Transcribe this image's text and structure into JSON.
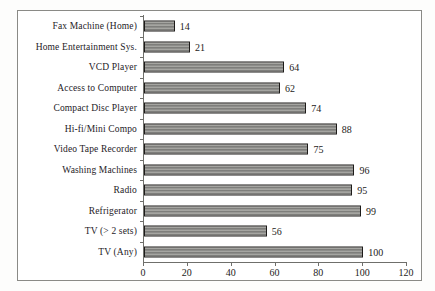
{
  "figure": {
    "background_color": "#ffffff",
    "frame_color": "#8a8a86",
    "bar_fill_color": "#999996",
    "bar_border_color": "#1d1b19",
    "text_color": "#1d1b19"
  },
  "chart_data": {
    "type": "bar",
    "orientation": "horizontal",
    "title": "",
    "subtitle": "",
    "xlabel": "",
    "ylabel": "",
    "xlim": [
      0,
      120
    ],
    "grid": false,
    "legend": null,
    "data_labels": true,
    "xticks": [
      0,
      20,
      40,
      60,
      80,
      100,
      120
    ],
    "xticklabels": [
      "0",
      "20",
      "40",
      "60",
      "80",
      "100",
      "120"
    ],
    "categories": [
      "Fax Machine (Home)",
      "Home Entertainment Sys.",
      "VCD Player",
      "Access to Computer",
      "Compact Disc Player",
      "Hi-fi/Mini Compo",
      "Video Tape Recorder",
      "Washing Machines",
      "Radio",
      "Refrigerator",
      "TV (> 2 sets)",
      "TV (Any)"
    ],
    "values": [
      14,
      21,
      64,
      62,
      74,
      88,
      75,
      96,
      95,
      99,
      56,
      100
    ],
    "value_labels": [
      "14",
      "21",
      "64",
      "62",
      "74",
      "88",
      "75",
      "96",
      "95",
      "99",
      "56",
      "100"
    ]
  }
}
